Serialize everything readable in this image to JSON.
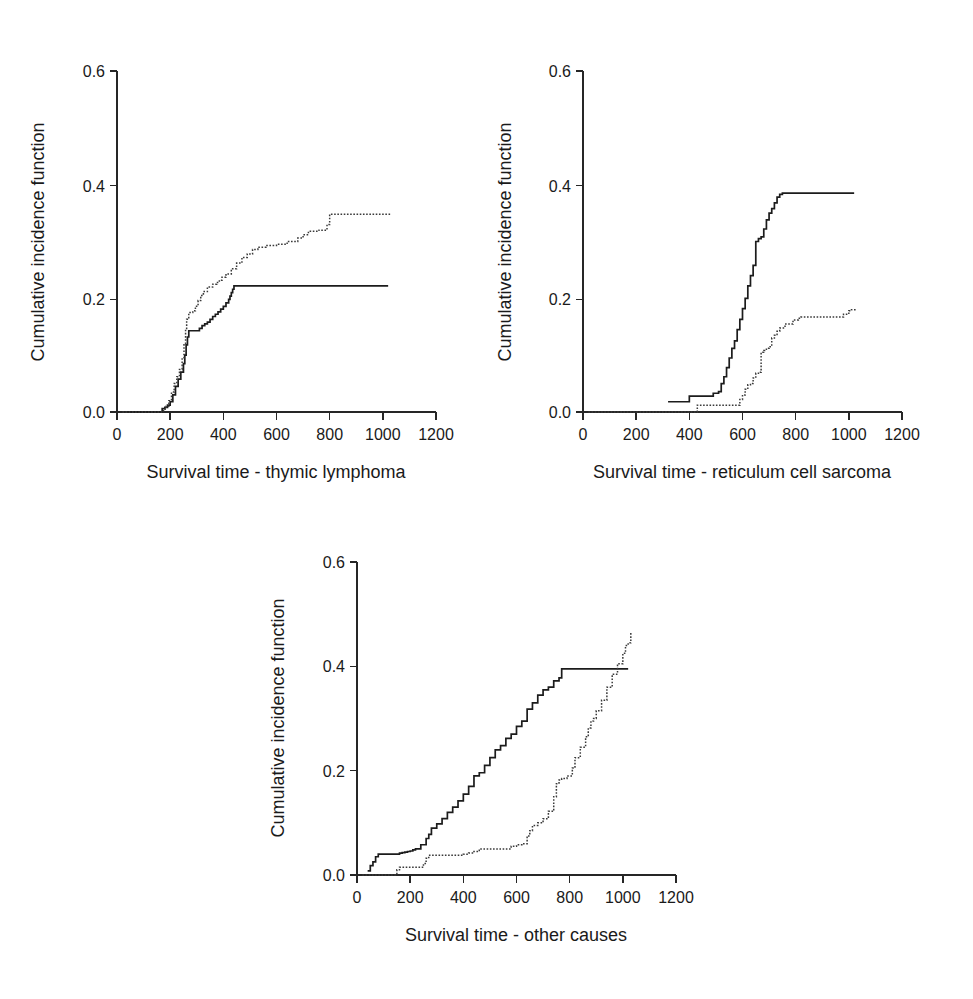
{
  "figure": {
    "background": "#ffffff",
    "ink_color": "#1a1a1a",
    "panel_count": 3
  },
  "chart_data": [
    {
      "id": "thymic-lymphoma",
      "type": "line",
      "title": "",
      "xlabel": "Survival time - thymic lymphoma",
      "ylabel": "Cumulative incidence function",
      "xlim": [
        0,
        1200
      ],
      "ylim": [
        0.0,
        0.6
      ],
      "xticks": [
        0,
        200,
        400,
        600,
        800,
        1000,
        1200
      ],
      "xtick_labels": [
        "0",
        "200",
        "400",
        "600",
        "800",
        "1000",
        "1200"
      ],
      "yticks": [
        0.0,
        0.2,
        0.4,
        0.6
      ],
      "ytick_labels": [
        "0.0",
        "0.2",
        "0.4",
        "0.6"
      ],
      "grid": false,
      "legend": "none",
      "step_interpolation": "post",
      "series": [
        {
          "name": "group-solid",
          "style": "solid",
          "color": "#1c1c1c",
          "x": [
            40,
            160,
            170,
            180,
            190,
            200,
            210,
            220,
            230,
            240,
            250,
            255,
            260,
            265,
            270,
            300,
            310,
            320,
            330,
            340,
            350,
            360,
            370,
            380,
            390,
            400,
            410,
            420,
            425,
            430,
            435,
            440,
            1020
          ],
          "y": [
            0.0,
            0.0,
            0.006,
            0.008,
            0.012,
            0.018,
            0.03,
            0.045,
            0.058,
            0.07,
            0.085,
            0.1,
            0.118,
            0.132,
            0.143,
            0.143,
            0.147,
            0.152,
            0.155,
            0.158,
            0.163,
            0.168,
            0.172,
            0.176,
            0.181,
            0.186,
            0.192,
            0.198,
            0.204,
            0.21,
            0.216,
            0.222,
            0.222
          ]
        },
        {
          "name": "group-dotted",
          "style": "dotted",
          "color": "#3a3a3a",
          "x": [
            20,
            160,
            175,
            185,
            195,
            205,
            215,
            225,
            235,
            245,
            252,
            258,
            262,
            270,
            285,
            295,
            305,
            315,
            325,
            340,
            360,
            375,
            385,
            395,
            410,
            430,
            450,
            470,
            490,
            510,
            530,
            560,
            600,
            640,
            680,
            700,
            720,
            760,
            790,
            800,
            1030
          ],
          "y": [
            0.0,
            0.0,
            0.005,
            0.01,
            0.02,
            0.035,
            0.05,
            0.062,
            0.075,
            0.095,
            0.12,
            0.145,
            0.163,
            0.175,
            0.178,
            0.186,
            0.196,
            0.205,
            0.212,
            0.22,
            0.225,
            0.228,
            0.232,
            0.237,
            0.243,
            0.252,
            0.262,
            0.272,
            0.278,
            0.286,
            0.29,
            0.293,
            0.295,
            0.3,
            0.306,
            0.312,
            0.318,
            0.32,
            0.33,
            0.348,
            0.348
          ]
        }
      ]
    },
    {
      "id": "reticulum-cell-sarcoma",
      "type": "line",
      "title": "",
      "xlabel": "Survival time - reticulum cell sarcoma",
      "ylabel": "Cumulative incidence function",
      "xlim": [
        0,
        1200
      ],
      "ylim": [
        0.0,
        0.6
      ],
      "xticks": [
        0,
        200,
        400,
        600,
        800,
        1000,
        1200
      ],
      "xtick_labels": [
        "0",
        "200",
        "400",
        "600",
        "800",
        "1000",
        "1200"
      ],
      "yticks": [
        0.0,
        0.2,
        0.4,
        0.6
      ],
      "ytick_labels": [
        "0.0",
        "0.2",
        "0.4",
        "0.6"
      ],
      "grid": false,
      "legend": "none",
      "step_interpolation": "post",
      "series": [
        {
          "name": "group-solid",
          "style": "solid",
          "color": "#1c1c1c",
          "x": [
            320,
            390,
            400,
            470,
            490,
            510,
            520,
            530,
            540,
            550,
            560,
            570,
            580,
            590,
            600,
            610,
            620,
            630,
            640,
            650,
            660,
            670,
            680,
            690,
            700,
            710,
            720,
            730,
            740,
            750,
            1020
          ],
          "y": [
            0.018,
            0.018,
            0.028,
            0.028,
            0.033,
            0.036,
            0.05,
            0.062,
            0.078,
            0.095,
            0.112,
            0.125,
            0.145,
            0.163,
            0.182,
            0.2,
            0.222,
            0.24,
            0.258,
            0.3,
            0.305,
            0.308,
            0.322,
            0.338,
            0.35,
            0.358,
            0.368,
            0.378,
            0.383,
            0.385,
            0.385
          ]
        },
        {
          "name": "group-dotted",
          "style": "dotted",
          "color": "#3a3a3a",
          "x": [
            20,
            420,
            430,
            580,
            590,
            600,
            610,
            620,
            630,
            640,
            650,
            660,
            670,
            680,
            690,
            700,
            710,
            720,
            730,
            740,
            760,
            790,
            810,
            820,
            960,
            980,
            1000,
            1010,
            1030
          ],
          "y": [
            0.0,
            0.0,
            0.012,
            0.012,
            0.022,
            0.03,
            0.04,
            0.048,
            0.05,
            0.06,
            0.068,
            0.07,
            0.105,
            0.108,
            0.112,
            0.115,
            0.13,
            0.135,
            0.142,
            0.148,
            0.155,
            0.162,
            0.165,
            0.167,
            0.167,
            0.172,
            0.178,
            0.18,
            0.18
          ]
        }
      ]
    },
    {
      "id": "other-causes",
      "type": "line",
      "title": "",
      "xlabel": "Survival time - other causes",
      "ylabel": "Cumulative incidence function",
      "xlim": [
        0,
        1200
      ],
      "ylim": [
        0.0,
        0.6
      ],
      "xticks": [
        0,
        200,
        400,
        600,
        800,
        1000,
        1200
      ],
      "xtick_labels": [
        "0",
        "200",
        "400",
        "600",
        "800",
        "1000",
        "1200"
      ],
      "yticks": [
        0.0,
        0.2,
        0.4,
        0.6
      ],
      "ytick_labels": [
        "0.0",
        "0.2",
        "0.4",
        "0.6"
      ],
      "grid": false,
      "legend": "none",
      "step_interpolation": "post",
      "series": [
        {
          "name": "group-solid",
          "style": "solid",
          "color": "#1c1c1c",
          "x": [
            40,
            50,
            60,
            70,
            80,
            150,
            160,
            170,
            180,
            190,
            200,
            210,
            220,
            240,
            260,
            270,
            280,
            300,
            320,
            340,
            360,
            380,
            400,
            420,
            440,
            460,
            480,
            500,
            520,
            540,
            560,
            580,
            600,
            620,
            640,
            660,
            680,
            700,
            720,
            740,
            760,
            770,
            1020
          ],
          "y": [
            0.008,
            0.018,
            0.025,
            0.035,
            0.04,
            0.04,
            0.042,
            0.043,
            0.044,
            0.045,
            0.046,
            0.048,
            0.05,
            0.058,
            0.07,
            0.078,
            0.09,
            0.098,
            0.108,
            0.12,
            0.13,
            0.142,
            0.155,
            0.17,
            0.19,
            0.196,
            0.21,
            0.225,
            0.24,
            0.248,
            0.262,
            0.27,
            0.285,
            0.295,
            0.318,
            0.33,
            0.345,
            0.355,
            0.36,
            0.372,
            0.378,
            0.395,
            0.395
          ]
        },
        {
          "name": "group-dotted",
          "style": "dotted",
          "color": "#3a3a3a",
          "x": [
            20,
            140,
            150,
            160,
            240,
            250,
            260,
            270,
            380,
            400,
            420,
            440,
            460,
            560,
            580,
            600,
            620,
            640,
            650,
            660,
            680,
            700,
            720,
            740,
            750,
            760,
            770,
            790,
            810,
            820,
            840,
            860,
            870,
            880,
            890,
            900,
            920,
            940,
            960,
            980,
            1000,
            1010,
            1020,
            1030
          ],
          "y": [
            0.0,
            0.0,
            0.01,
            0.015,
            0.015,
            0.022,
            0.032,
            0.038,
            0.038,
            0.04,
            0.042,
            0.045,
            0.05,
            0.05,
            0.055,
            0.058,
            0.06,
            0.075,
            0.085,
            0.095,
            0.1,
            0.108,
            0.122,
            0.15,
            0.175,
            0.182,
            0.185,
            0.19,
            0.205,
            0.225,
            0.245,
            0.265,
            0.282,
            0.295,
            0.3,
            0.315,
            0.335,
            0.36,
            0.385,
            0.405,
            0.425,
            0.44,
            0.445,
            0.465
          ]
        }
      ]
    }
  ]
}
